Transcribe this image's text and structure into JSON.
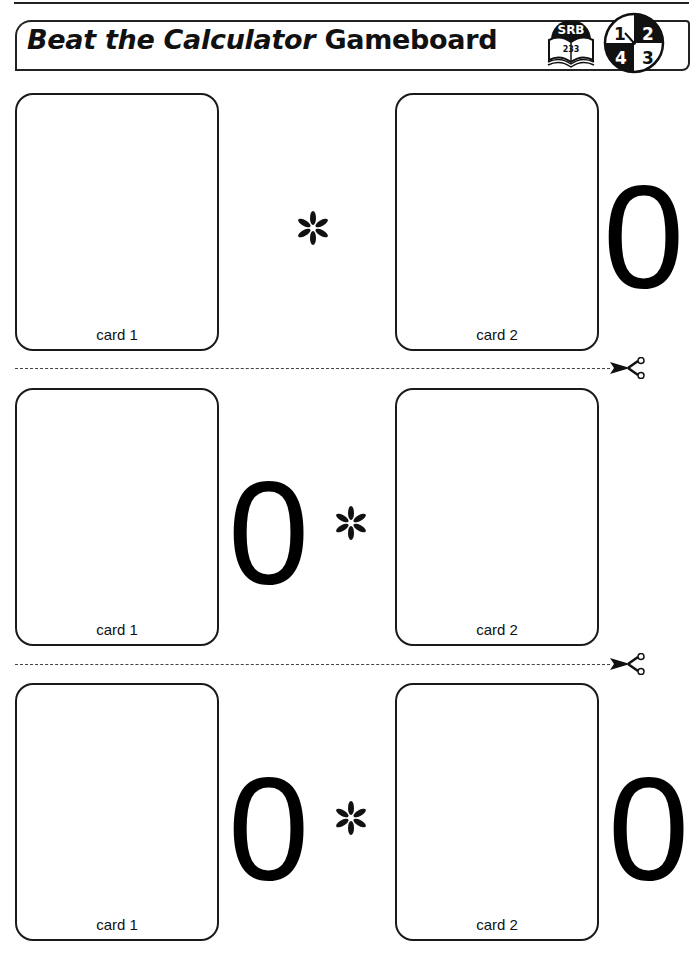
{
  "header": {
    "title_italic": "Beat the Calculator",
    "title_rest": " Gameboard",
    "srb_badge": {
      "label": "SRB",
      "page": "233",
      "icon": "book-icon"
    },
    "clock_badge": {
      "quadrants": [
        "1",
        "2",
        "3",
        "4"
      ],
      "icon": "clock-icon"
    }
  },
  "rows": [
    {
      "layout": "card1 * card2 0",
      "card1_label": "card 1",
      "operator": "*",
      "card2_label": "card 2",
      "zeros": [
        {
          "position": "after-card2",
          "text": "0"
        }
      ]
    },
    {
      "layout": "card1 0 * card2",
      "card1_label": "card 1",
      "operator": "*",
      "card2_label": "card 2",
      "zeros": [
        {
          "position": "after-card1",
          "text": "0"
        }
      ]
    },
    {
      "layout": "card1 0 * card2 0",
      "card1_label": "card 1",
      "operator": "*",
      "card2_label": "card 2",
      "zeros": [
        {
          "position": "after-card1",
          "text": "0"
        },
        {
          "position": "after-card2",
          "text": "0"
        }
      ]
    }
  ],
  "cut_lines": [
    {
      "icon": "scissors-icon"
    },
    {
      "icon": "scissors-icon"
    }
  ],
  "colors": {
    "ink": "#111111",
    "paper": "#ffffff"
  }
}
